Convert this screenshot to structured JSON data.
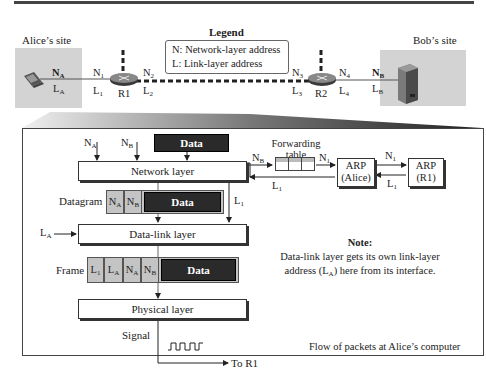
{
  "top_diagram": {
    "alice_site": "Alice’s site",
    "bob_site": "Bob’s site",
    "legend": {
      "title": "Legend",
      "line1": "N: Network-layer address",
      "line2": "L: Link-layer address"
    },
    "alice_labels": {
      "n": "N",
      "n_sub": "A",
      "l": "L",
      "l_sub": "A"
    },
    "bob_labels": {
      "n": "N",
      "n_sub": "B",
      "l": "L",
      "l_sub": "B"
    },
    "r1": {
      "name": "R1",
      "n_left": "N",
      "n_left_sub": "1",
      "l_left": "L",
      "l_left_sub": "1",
      "n_right": "N",
      "n_right_sub": "2",
      "l_right": "L",
      "l_right_sub": "2"
    },
    "r2": {
      "name": "R2",
      "n_left": "N",
      "n_left_sub": "3",
      "l_left": "L",
      "l_left_sub": "3",
      "n_right": "N",
      "n_right_sub": "4",
      "l_right": "L",
      "l_right_sub": "4"
    }
  },
  "detail": {
    "inputs": {
      "na": "N",
      "na_sub": "A",
      "nb": "N",
      "nb_sub": "B",
      "data": "Data"
    },
    "network_layer": "Network layer",
    "datagram_label": "Datagram",
    "datagram": {
      "c1": "N",
      "c1_sub": "A",
      "c2": "N",
      "c2_sub": "B",
      "data": "Data"
    },
    "l1_label": "L",
    "l1_sub": "1",
    "la_label": "L",
    "la_sub": "A",
    "data_link_layer": "Data-link layer",
    "frame_label": "Frame",
    "frame": {
      "c1": "L",
      "c1_sub": "1",
      "c2": "L",
      "c2_sub": "A",
      "c3": "N",
      "c3_sub": "A",
      "c4": "N",
      "c4_sub": "B",
      "data": "Data"
    },
    "physical_layer": "Physical layer",
    "signal_label": "Signal",
    "to_r1": "To R1",
    "forwarding_table": {
      "line1": "Forwarding",
      "line2": "table"
    },
    "nb_to_table": "N",
    "nb_to_table_sub": "B",
    "n1_to_arp": "N",
    "n1_to_arp_sub": "1",
    "arp_alice": {
      "line1": "ARP",
      "line2": "(Alice)"
    },
    "arp_r1": {
      "line1": "ARP",
      "line2": "(R1)"
    },
    "n1_to_r1": "N",
    "n1_to_r1_sub": "1",
    "l1_from_r1": "L",
    "l1_from_r1_sub": "1",
    "l1_back": "L",
    "l1_back_sub": "1",
    "note": {
      "title": "Note:",
      "line1": "Data-link layer gets its own link-layer",
      "line2_pre": "address (L",
      "line2_sub": "A",
      "line2_post": ") here from its interface."
    },
    "caption": "Flow of packets at Alice’s computer"
  }
}
